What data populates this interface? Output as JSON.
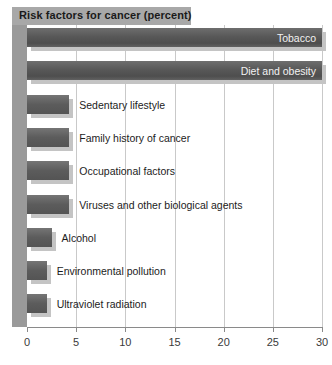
{
  "chart_data": {
    "type": "bar",
    "orientation": "horizontal",
    "title": "Risk factors for cancer (percent)",
    "xlabel": "",
    "ylabel": "",
    "xlim": [
      0,
      30
    ],
    "xticks": [
      0,
      5,
      10,
      15,
      20,
      25,
      30
    ],
    "xtick_labels": [
      "0",
      "5",
      "10",
      "15",
      "20",
      "25",
      "30"
    ],
    "grid": true,
    "grid_axis": "x",
    "legend": "none",
    "categories": [
      "Tobacco",
      "Diet and obesity",
      "Sedentary lifestyle",
      "Family history of cancer",
      "Occupational factors",
      "Viruses and other biological agents",
      "Alcohol",
      "Environmental pollution",
      "Ultraviolet radiation"
    ],
    "values": [
      30,
      30,
      4.3,
      4.3,
      4.3,
      4.3,
      2.5,
      2,
      2
    ],
    "label_placement": [
      "inside",
      "inside",
      "outside",
      "outside",
      "outside",
      "outside",
      "outside",
      "outside",
      "outside"
    ],
    "colors": {
      "bar": "#585858",
      "bar_shadow": "#c4c4c4",
      "title_band": "#a8a8a8",
      "left_band": "#9a9a9a",
      "gridline": "#c9c9c9",
      "axis": "#8a8a8a",
      "background": "#ffffff",
      "text": "#1c1c1c",
      "inside_label_text": "#f2f2f2"
    }
  }
}
